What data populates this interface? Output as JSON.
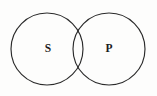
{
  "figure": {
    "kind": "venn-diagram",
    "background_color": "#fdfdfc",
    "stroke_color": "#2b2b2b",
    "label_color": "#1c1c1c"
  },
  "circles": [
    {
      "id": "subject-circle",
      "label": "S",
      "cx": 47,
      "cy": 49,
      "r": 36,
      "label_x": 48,
      "label_y": 49
    },
    {
      "id": "predicate-circle",
      "label": "P",
      "cx": 109,
      "cy": 49,
      "r": 36,
      "label_x": 109,
      "label_y": 49
    }
  ],
  "intersection": {
    "id": "lens-region",
    "top_crossing_x": 78,
    "top_crossing_y": 20,
    "bottom_crossing_x": 78,
    "bottom_crossing_y": 78
  }
}
